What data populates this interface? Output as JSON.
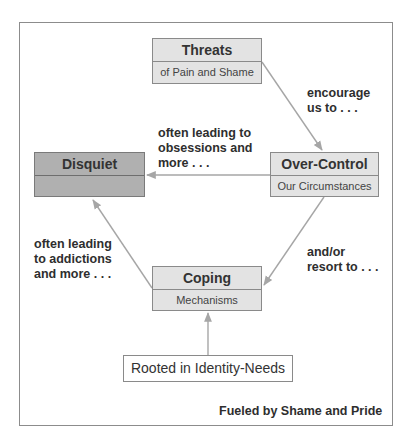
{
  "diagram": {
    "nodes": {
      "threats": {
        "title": "Threats",
        "subtitle": "of Pain and Shame"
      },
      "over_control": {
        "title": "Over-Control",
        "subtitle": "Our Circumstances"
      },
      "disquiet": {
        "title": "Disquiet",
        "subtitle": ""
      },
      "coping": {
        "title": "Coping",
        "subtitle": "Mechanisms"
      },
      "rooted": {
        "title": "Rooted in Identity-Needs"
      }
    },
    "edges": {
      "threats_to_over_control": "encourage\nus to . . .",
      "over_control_to_disquiet": "often leading to\nobsessions and\nmore . . .",
      "over_control_to_coping": "and/or\nresort to . . .",
      "coping_to_disquiet": "often leading\nto addictions\nand more . . ."
    },
    "footer": "Fueled by Shame and Pride",
    "colors": {
      "node_fill": "#e3e3e3",
      "disquiet_fill": "#b0b0b0",
      "arrow": "#a6a6a6",
      "border": "#8a8a8a"
    }
  }
}
